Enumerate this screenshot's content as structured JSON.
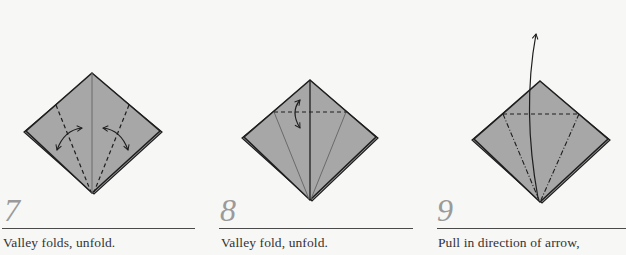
{
  "steps": [
    {
      "number": "7",
      "caption": "Valley folds, unfold."
    },
    {
      "number": "8",
      "caption": "Valley fold, unfold."
    },
    {
      "number": "9",
      "caption": "Pull in direction of arrow,"
    }
  ],
  "colors": {
    "paper": "#a7a7a7",
    "outline": "#1e1e1e",
    "number": "#9a9a9a",
    "rule": "#4a4a4a",
    "background": "#f7f7f6"
  }
}
